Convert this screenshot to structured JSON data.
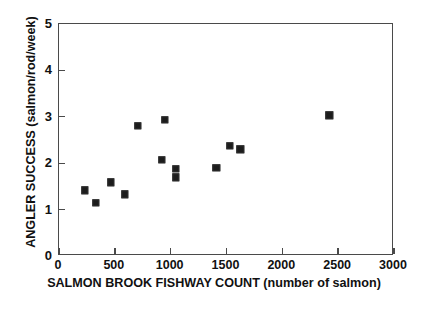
{
  "chart_data": {
    "type": "scatter",
    "title": "",
    "xlabel": "SALMON BROOK FISHWAY COUNT (number of salmon)",
    "ylabel": "ANGLER SUCCESS (salmon/rod/week)",
    "xlim": [
      0,
      3000
    ],
    "ylim": [
      0,
      5
    ],
    "xticks": [
      0,
      500,
      1000,
      1500,
      2000,
      2500,
      3000
    ],
    "yticks": [
      0,
      1,
      2,
      3,
      4,
      5
    ],
    "xtick_labels": [
      "0",
      "500",
      "1000",
      "1500",
      "2000",
      "2500",
      "3000"
    ],
    "ytick_labels": [
      "0",
      "1",
      "2",
      "3",
      "4",
      "5"
    ],
    "grid": false,
    "legend": null,
    "marker": "filled-square",
    "marker_color": "#1c1c1c",
    "points": [
      {
        "x": 232,
        "y": 1.42
      },
      {
        "x": 330,
        "y": 1.14
      },
      {
        "x": 464,
        "y": 1.59
      },
      {
        "x": 589,
        "y": 1.33
      },
      {
        "x": 705,
        "y": 2.8
      },
      {
        "x": 920,
        "y": 2.07
      },
      {
        "x": 946,
        "y": 2.93
      },
      {
        "x": 1045,
        "y": 1.88
      },
      {
        "x": 1045,
        "y": 1.7
      },
      {
        "x": 1410,
        "y": 1.9
      },
      {
        "x": 1527,
        "y": 2.37
      },
      {
        "x": 1625,
        "y": 2.3
      },
      {
        "x": 2420,
        "y": 3.03
      }
    ]
  },
  "style": {
    "frame_color": "#4a4a4a",
    "text_color": "#111111",
    "background": "#ffffff"
  }
}
